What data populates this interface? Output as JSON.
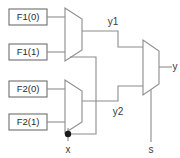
{
  "diagram": {
    "colors": {
      "wire": "#8c8c8c",
      "box_border": "#6e6e6e",
      "text": "#2b2b2b",
      "background": "#ffffff",
      "junction": "#1a1a1a"
    },
    "input_boxes": [
      {
        "id": "f1_0",
        "label": "F1(0)"
      },
      {
        "id": "f1_1",
        "label": "F1(1)"
      },
      {
        "id": "f2_0",
        "label": "F2(0)"
      },
      {
        "id": "f2_1",
        "label": "F2(1)"
      }
    ],
    "multiplexers": [
      {
        "id": "mux1",
        "inputs": [
          "F1(0)",
          "F1(1)"
        ],
        "select": "x",
        "output": "y1"
      },
      {
        "id": "mux2",
        "inputs": [
          "F2(0)",
          "F2(1)"
        ],
        "select": "x",
        "output": "y2"
      },
      {
        "id": "mux3",
        "inputs": [
          "y1",
          "y2"
        ],
        "select": "s",
        "output": "y"
      }
    ],
    "net_labels": [
      {
        "id": "y1",
        "label": "y1"
      },
      {
        "id": "y2",
        "label": "y2"
      },
      {
        "id": "y",
        "label": "y"
      },
      {
        "id": "x",
        "label": "x"
      },
      {
        "id": "s",
        "label": "s"
      }
    ]
  }
}
